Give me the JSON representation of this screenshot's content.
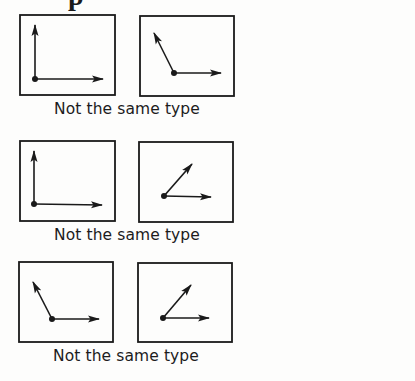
{
  "header": {
    "cropped_glyph": "p"
  },
  "colors": {
    "ink": "#1a1a1a",
    "background": "#fdfdfc"
  },
  "rows": [
    {
      "caption": "Not the same type",
      "caption_pos": {
        "x": 20,
        "y": 100
      },
      "panels": [
        {
          "box": {
            "x": 20,
            "y": 15,
            "w": 95,
            "h": 80
          },
          "origin": [
            35,
            79
          ],
          "vectors": [
            [
              35,
              25
            ],
            [
              103,
              79
            ]
          ],
          "description": "perpendicular vectors (up and right)"
        },
        {
          "box": {
            "x": 140,
            "y": 16,
            "w": 94,
            "h": 80
          },
          "origin": [
            174,
            73
          ],
          "vectors": [
            [
              154,
              33
            ],
            [
              221,
              73
            ]
          ],
          "description": "obtuse angle vectors (up-left and right)"
        }
      ]
    },
    {
      "caption": "Not the same type",
      "caption_pos": {
        "x": 20,
        "y": 226
      },
      "panels": [
        {
          "box": {
            "x": 20,
            "y": 141,
            "w": 95,
            "h": 80
          },
          "origin": [
            34,
            204
          ],
          "vectors": [
            [
              34,
              151
            ],
            [
              102,
              205
            ]
          ],
          "description": "perpendicular vectors (up and right)"
        },
        {
          "box": {
            "x": 139,
            "y": 142,
            "w": 94,
            "h": 80
          },
          "origin": [
            164,
            196
          ],
          "vectors": [
            [
              192,
              164
            ],
            [
              211,
              197
            ]
          ],
          "description": "acute angle vectors (up-right and right)"
        }
      ]
    },
    {
      "caption": "Not the same type",
      "caption_pos": {
        "x": 19,
        "y": 347
      },
      "panels": [
        {
          "box": {
            "x": 19,
            "y": 262,
            "w": 94,
            "h": 80
          },
          "origin": [
            52,
            319
          ],
          "vectors": [
            [
              33,
              282
            ],
            [
              99,
              319
            ]
          ],
          "description": "obtuse angle vectors (up-left and right)"
        },
        {
          "box": {
            "x": 138,
            "y": 263,
            "w": 94,
            "h": 79
          },
          "origin": [
            163,
            318
          ],
          "vectors": [
            [
              191,
              285
            ],
            [
              209,
              318
            ]
          ],
          "description": "acute angle vectors (up-right and right)"
        }
      ]
    }
  ]
}
